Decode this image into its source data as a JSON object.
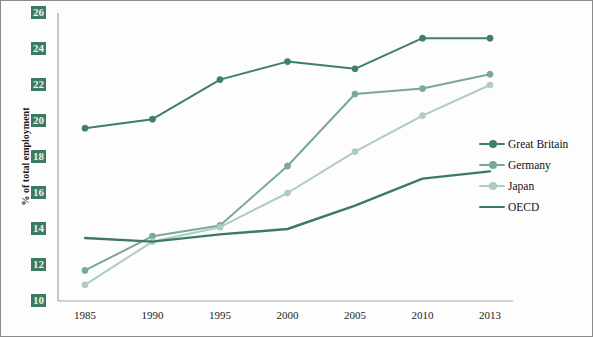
{
  "chart_data": {
    "type": "line",
    "title": "",
    "xlabel": "",
    "ylabel": "% of total employment",
    "categories": [
      "1985",
      "1990",
      "1995",
      "2000",
      "2005",
      "2010",
      "2013"
    ],
    "ylim": [
      10,
      26
    ],
    "ytick_step": 2,
    "yticks": [
      "10",
      "12",
      "14",
      "16",
      "18",
      "20",
      "22",
      "24",
      "26"
    ],
    "grid": false,
    "legend_position": "right",
    "series": [
      {
        "name": "Great Britain",
        "color": "#3f7f68",
        "marker": true,
        "values": [
          19.6,
          20.1,
          22.3,
          23.3,
          22.9,
          24.6,
          24.6
        ]
      },
      {
        "name": "Germany",
        "color": "#79a897",
        "marker": true,
        "values": [
          11.7,
          13.6,
          14.2,
          17.5,
          21.5,
          21.8,
          22.6
        ]
      },
      {
        "name": "Japan",
        "color": "#afcbc2",
        "marker": true,
        "values": [
          10.9,
          13.3,
          14.1,
          16.0,
          18.3,
          20.3,
          22.0
        ]
      },
      {
        "name": "OECD",
        "color": "#3c7a63",
        "marker": false,
        "values": [
          13.5,
          13.3,
          13.7,
          14.0,
          15.3,
          16.8,
          17.2
        ]
      }
    ]
  },
  "axis": {
    "y_title": "% of total employment"
  },
  "legend": {
    "items": [
      {
        "label": "Great Britain"
      },
      {
        "label": "Germany"
      },
      {
        "label": "Japan"
      },
      {
        "label": "OECD"
      }
    ]
  }
}
